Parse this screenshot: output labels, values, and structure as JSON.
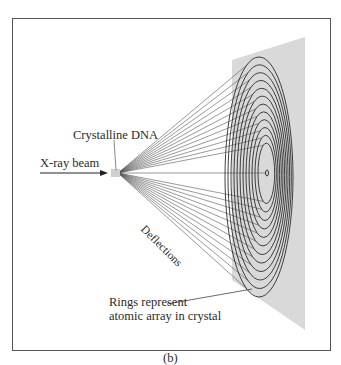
{
  "figure": {
    "caption": "(b)",
    "labels": {
      "crystal": "Crystalline DNA",
      "beam": "X-ray beam",
      "deflections": "Deflections",
      "rings_line1": "Rings represent",
      "rings_line2": "atomic array in crystal"
    },
    "colors": {
      "frame": "#555555",
      "panel": "#d9d9d9",
      "rings": "#2b2b2b",
      "rays": "#555555",
      "text": "#2a2a2a"
    },
    "ring_count": 12
  }
}
